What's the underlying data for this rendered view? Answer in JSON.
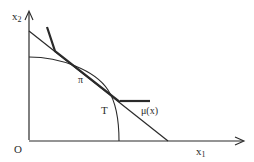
{
  "diagram": {
    "axes": {
      "x_label": "x",
      "x_sub": "1",
      "y_label": "x",
      "y_sub": "2",
      "origin_label": "O"
    },
    "labels": {
      "tangent_point": "π",
      "frontier": "T",
      "mu_curve": "μ(x)"
    },
    "colors": {
      "line": "#2a2a2a",
      "background": "#ffffff"
    }
  }
}
